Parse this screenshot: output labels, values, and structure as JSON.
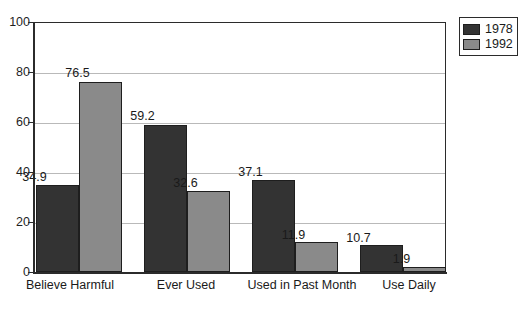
{
  "chart_data": {
    "type": "bar",
    "title": "",
    "subtitle": "",
    "xlabel": "",
    "ylabel": "",
    "ylim": [
      0,
      100
    ],
    "yticks": [
      0,
      20,
      40,
      60,
      80,
      100
    ],
    "ytick_labels": [
      "0",
      "20",
      "40",
      "60",
      "80",
      "100"
    ],
    "grid": "horizontal",
    "legend_position": "top-right",
    "categories": [
      "Believe Harmful",
      "Ever Used",
      "Used in Past Month",
      "Use Daily"
    ],
    "series": [
      {
        "name": "1978",
        "color": "#333333",
        "values": [
          34.9,
          59.2,
          37.1,
          10.7
        ],
        "labels": [
          "34.9",
          "59.2",
          "37.1",
          "10.7"
        ]
      },
      {
        "name": "1992",
        "color": "#8a8a8a",
        "values": [
          76.5,
          32.6,
          11.9,
          1.9
        ],
        "labels": [
          "76.5",
          "32.6",
          "11.9",
          "1.9"
        ]
      }
    ]
  },
  "legend": {
    "entries": [
      {
        "label": "1978",
        "color": "#333333"
      },
      {
        "label": "1992",
        "color": "#8a8a8a"
      }
    ]
  },
  "colors": {
    "series_1978": "#333333",
    "series_1992": "#8a8a8a",
    "axis": "#2b2b2b",
    "gridline": "#b9b9b9",
    "background": "#ffffff",
    "text": "#1a1a1a"
  }
}
